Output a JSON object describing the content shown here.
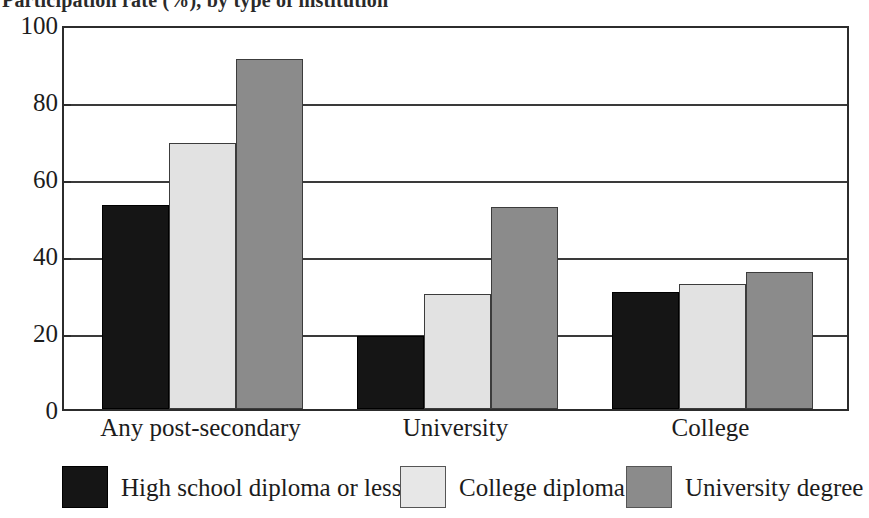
{
  "title": {
    "text": "Participation rate (%), by type of institution",
    "clipped": true
  },
  "chart_data": {
    "type": "bar",
    "title": "Participation rate (%), by type of institution",
    "xlabel": "",
    "ylabel": "",
    "categories": [
      "Any post-secondary",
      "University",
      "College"
    ],
    "series": [
      {
        "name": "High school diploma or less",
        "color": "#151515",
        "values": [
          53,
          19,
          30.5
        ]
      },
      {
        "name": "College diploma",
        "color": "#e2e2e2",
        "values": [
          69,
          30,
          32.5
        ]
      },
      {
        "name": "University degree",
        "color": "#8b8b8b",
        "values": [
          91,
          52.5,
          35.5
        ]
      }
    ],
    "ylim": [
      0,
      100
    ],
    "yticks": [
      "0",
      "20",
      "40",
      "60",
      "80",
      "100"
    ],
    "grid": true,
    "legend_position": "bottom"
  },
  "axis": {
    "y_ticks": [
      "100",
      "80",
      "60",
      "40",
      "20",
      "0"
    ]
  },
  "legend": {
    "items": [
      {
        "label": "High school diploma or less",
        "swatch": "black-swatch"
      },
      {
        "label": "College diploma",
        "swatch": "light-gray-swatch"
      },
      {
        "label": "University degree",
        "swatch": "dark-gray-swatch"
      }
    ]
  },
  "colors": {
    "series_high_school": "#151515",
    "series_college": "#e2e2e2",
    "series_university": "#8b8b8b",
    "axis": "#2c2c2c",
    "background": "#ffffff"
  }
}
